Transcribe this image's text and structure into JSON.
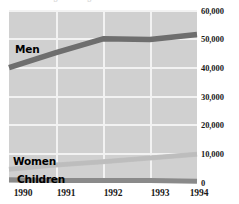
{
  "chart_data": {
    "type": "line",
    "title": "",
    "xlabel": "",
    "ylabel": "",
    "x": [
      "1990",
      "1991",
      "1992",
      "1993",
      "1994"
    ],
    "categories": [
      "1990",
      "1991",
      "1992",
      "1993",
      "1994"
    ],
    "ylim": [
      0,
      60000
    ],
    "yticks": [
      "0",
      "10,000",
      "20,000",
      "30,000",
      "40,000",
      "50,000",
      "60,000"
    ],
    "ytick_values": [
      0,
      10000,
      20000,
      30000,
      40000,
      50000,
      60000
    ],
    "grid": true,
    "legend_position": "inline-labels",
    "series": [
      {
        "name": "Men",
        "values": [
          40000,
          45200,
          50000,
          49800,
          51500
        ],
        "color": "#6e6e6e"
      },
      {
        "name": "Women",
        "values": [
          4800,
          6200,
          7400,
          8700,
          10000
        ],
        "color": "#c2c2c2"
      },
      {
        "name": "Children",
        "values": [
          1100,
          900,
          900,
          900,
          600
        ],
        "color": "#8a8a8a"
      }
    ],
    "annotations": [
      {
        "text": "Men",
        "series": "Men"
      },
      {
        "text": "Women",
        "series": "Women"
      },
      {
        "text": "Children",
        "series": "Children"
      }
    ]
  },
  "axes": {
    "y_labels": [
      "60,000",
      "50,000",
      "40,000",
      "30,000",
      "20,000",
      "10,000",
      "0"
    ],
    "x_labels": [
      "1990",
      "1991",
      "1992",
      "1993",
      "1994"
    ]
  },
  "series_labels": {
    "men": "Men",
    "women": "Women",
    "children": "Children"
  },
  "header": {
    "cropped_title": "Immigration figures"
  },
  "colors": {
    "plot_background": "#d0d0d0",
    "gridline": "#f2f2f2",
    "men_line": "#6e6e6e",
    "women_line": "#c2c2c2",
    "children_line": "#8a8a8a",
    "text": "#1a1a1a",
    "page_background": "#ffffff"
  }
}
